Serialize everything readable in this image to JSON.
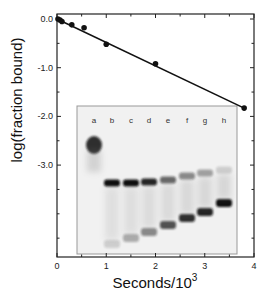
{
  "chart_data": {
    "type": "scatter",
    "title": "",
    "xlabel": "Seconds/10",
    "xlabel_superscript": "3",
    "ylabel": "log(fraction bound)",
    "xlim": [
      0,
      4
    ],
    "ylim": [
      -4.9,
      0.1
    ],
    "grid": false,
    "legend": null,
    "x_ticks": [
      0,
      1,
      2,
      3,
      4
    ],
    "x_tick_labels": [
      "0",
      "1",
      "2",
      "3",
      "4"
    ],
    "x_minor_ticks": [
      0.5,
      1.5,
      2.5,
      3.5
    ],
    "y_ticks": [
      0.0,
      -1.0,
      -2.0,
      -3.0
    ],
    "y_tick_labels": [
      "0.0",
      "-1.0",
      "-2.0",
      "-3.0"
    ],
    "y_minor_ticks": [
      -0.5,
      -1.5,
      -2.5,
      -3.5,
      -4.0,
      -4.5
    ],
    "series": [
      {
        "name": "data",
        "marker": "filled-circle",
        "x": [
          0.02,
          0.06,
          0.1,
          0.3,
          0.55,
          1.0,
          2.0,
          3.8
        ],
        "y": [
          0.0,
          -0.02,
          -0.05,
          -0.12,
          -0.18,
          -0.52,
          -0.92,
          -1.83
        ]
      },
      {
        "name": "linear fit",
        "style": "line",
        "x": [
          0.0,
          3.8
        ],
        "y": [
          0.0,
          -1.83
        ]
      }
    ],
    "inset": {
      "type": "gel-image",
      "lanes": [
        "a",
        "b",
        "c",
        "d",
        "e",
        "f",
        "g",
        "h"
      ],
      "upper_band_intensity": [
        0,
        1.0,
        1.0,
        0.9,
        0.6,
        0.45,
        0.35,
        0.15
      ],
      "lower_band_intensity": [
        0,
        0.15,
        0.3,
        0.45,
        0.7,
        0.85,
        0.9,
        1.0
      ],
      "note": "Lane a shows a single band higher up; lanes b-h show bound band decreasing and free band increasing over time"
    }
  },
  "colors": {
    "axis": "#222222",
    "line": "#111111",
    "marker": "#111111",
    "gel_background": "#f1f1f1",
    "gel_border": "#999999",
    "band": "#111111"
  }
}
